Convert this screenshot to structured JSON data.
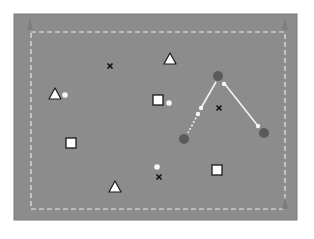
{
  "diagram": {
    "title": "",
    "colors": {
      "background": "#ffffff",
      "pitch": "#8c8c8c",
      "pitch_border": "#7a7a7a",
      "boundary_line": "#e6e6e6",
      "cone": "#7d7d7d",
      "player_fill": "#ffffff",
      "player_stroke": "#1a1a1a",
      "marker": "#111111",
      "dark_player": "#5a5a5a",
      "pass_line": "#f2f2f2",
      "ball": "#f5f5f5"
    },
    "pitch": {
      "x": 14,
      "y": 14,
      "w": 283,
      "h": 206
    },
    "boundary": {
      "x": 31,
      "y": 32,
      "w": 254,
      "h": 177
    },
    "cones": [
      {
        "x": 30,
        "y": 21
      },
      {
        "x": 285,
        "y": 21
      },
      {
        "x": 285,
        "y": 200
      }
    ],
    "x_markers": [
      {
        "x": 110,
        "y": 66
      },
      {
        "x": 219,
        "y": 108
      },
      {
        "x": 159,
        "y": 177
      }
    ],
    "triangles": [
      {
        "x": 55,
        "y": 94
      },
      {
        "x": 170,
        "y": 59
      },
      {
        "x": 115,
        "y": 187
      }
    ],
    "squares": [
      {
        "x": 158,
        "y": 100
      },
      {
        "x": 71,
        "y": 143
      },
      {
        "x": 217,
        "y": 170
      }
    ],
    "balls": [
      {
        "x": 65,
        "y": 95
      },
      {
        "x": 169,
        "y": 103
      },
      {
        "x": 157,
        "y": 167
      }
    ],
    "dark_players": [
      {
        "x": 218,
        "y": 76
      },
      {
        "x": 184,
        "y": 139
      },
      {
        "x": 264,
        "y": 133
      }
    ],
    "pass_lines": [
      {
        "x1": 216,
        "y1": 82,
        "x2": 201,
        "y2": 108,
        "style": "solid"
      },
      {
        "x1": 198,
        "y1": 114,
        "x2": 188,
        "y2": 133,
        "style": "dotted"
      },
      {
        "x1": 224,
        "y1": 83,
        "x2": 258,
        "y2": 126,
        "style": "solid"
      }
    ],
    "pass_dots": [
      {
        "x": 201,
        "y": 108
      },
      {
        "x": 198,
        "y": 114
      },
      {
        "x": 224,
        "y": 84
      },
      {
        "x": 258,
        "y": 126
      }
    ]
  }
}
